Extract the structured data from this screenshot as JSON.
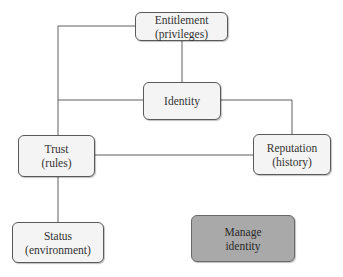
{
  "diagram": {
    "nodes": [
      {
        "id": "entitlement",
        "line1": "Entitlement",
        "line2": "(privileges)"
      },
      {
        "id": "identity",
        "line1": "Identity",
        "line2": ""
      },
      {
        "id": "trust",
        "line1": "Trust",
        "line2": "(rules)"
      },
      {
        "id": "reputation",
        "line1": "Reputation",
        "line2": "(history)"
      },
      {
        "id": "status",
        "line1": "Status",
        "line2": "(environment)"
      },
      {
        "id": "manage_identity",
        "line1": "Manage",
        "line2": "identity"
      }
    ],
    "edges": [
      {
        "from": "entitlement",
        "to": "identity"
      },
      {
        "from": "entitlement",
        "to": "trust"
      },
      {
        "from": "identity",
        "to": "trust"
      },
      {
        "from": "identity",
        "to": "reputation"
      },
      {
        "from": "trust",
        "to": "reputation"
      },
      {
        "from": "trust",
        "to": "status"
      }
    ],
    "colors": {
      "node_fill": "#f4f4f4",
      "highlight_fill": "#a9a9a9",
      "line": "#5a5a5a"
    }
  }
}
